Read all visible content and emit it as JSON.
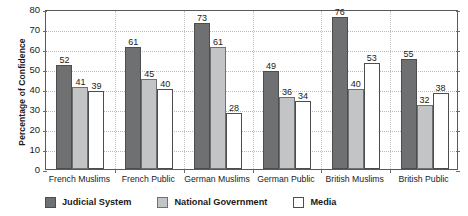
{
  "chart_data": {
    "type": "bar",
    "title": "",
    "xlabel": "",
    "ylabel": "Percentage of Confidence",
    "ylim": [
      0,
      80
    ],
    "yticks": [
      0,
      10,
      20,
      30,
      40,
      50,
      60,
      70,
      80
    ],
    "ytick_labels": [
      "0",
      "10",
      "20",
      "30",
      "40",
      "50",
      "60",
      "70",
      "80"
    ],
    "grid": "horizontal-dotted",
    "legend_position": "bottom-left",
    "data_labels": true,
    "categories": [
      "French Muslims",
      "French Public",
      "German Muslims",
      "German Public",
      "British Muslims",
      "British Public"
    ],
    "series": [
      {
        "name": "Judicial System",
        "color": "#6e7072",
        "values": [
          52,
          61,
          73,
          49,
          76,
          55
        ]
      },
      {
        "name": "National Government",
        "color": "#c2c4c6",
        "values": [
          41,
          45,
          61,
          36,
          40,
          32
        ]
      },
      {
        "name": "Media",
        "color": "#ffffff",
        "values": [
          39,
          40,
          28,
          34,
          53,
          38
        ]
      }
    ]
  },
  "legend": {
    "items": [
      {
        "label": "Judicial System",
        "swatch": "dark-gray-swatch"
      },
      {
        "label": "National Government",
        "swatch": "light-gray-swatch"
      },
      {
        "label": "Media",
        "swatch": "white-swatch"
      }
    ]
  },
  "axes": {
    "y_title": "Percentage of Confidence"
  }
}
